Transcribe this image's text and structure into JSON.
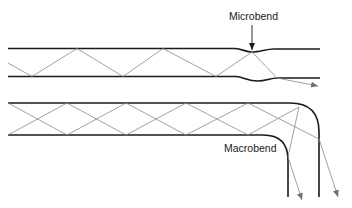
{
  "diagram": {
    "type": "optical-fiber-bending-loss",
    "labels": {
      "microbend": "Microbend",
      "macrobend": "Macrobend"
    },
    "colors": {
      "fiber_wall": "#1a1a1a",
      "ray": "#8a8a8a",
      "background": "#ffffff"
    },
    "panels": [
      {
        "name": "microbend-fiber",
        "description": "Straight fiber with small local deformation; ray escapes at the deformation"
      },
      {
        "name": "macrobend-fiber",
        "description": "Fiber with large radius bend; rays exceed critical angle and leak out"
      }
    ]
  }
}
